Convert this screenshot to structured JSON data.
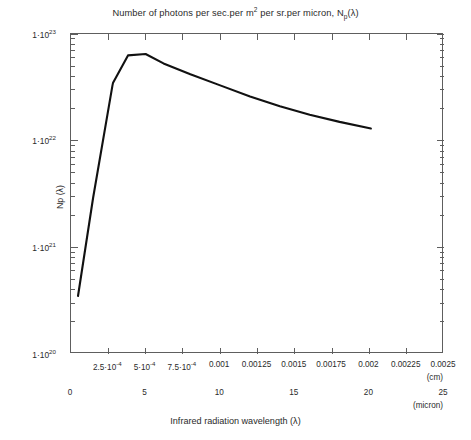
{
  "title_parts": {
    "lead": "Number of photons per sec.per m",
    "sup1": "2",
    "mid": " per sr.per micron, N",
    "sub1": "p",
    "tail": "(λ)"
  },
  "axes": {
    "y_title": "Np (λ)",
    "y_tick_labels": [
      "1·10",
      "1·10",
      "1·10",
      "1·10"
    ],
    "y_tick_exponents": [
      "23",
      "22",
      "21",
      "20"
    ],
    "x_title": "Infrared radiation wavelength (λ)",
    "x_unit_primary": "(cm)",
    "x_unit_secondary": "(micron)"
  },
  "caption": "",
  "chart_data": {
    "type": "line",
    "title": "Number of photons per sec.per m2 per sr.per micron, Np(λ)",
    "xlabel": "Infrared radiation wavelength (λ)",
    "ylabel": "Np (λ)",
    "yscale": "log",
    "ylim": [
      1e+20,
      1e+23
    ],
    "y_ticks": [
      1e+20,
      1e+21,
      1e+22,
      1e+23
    ],
    "y_tick_text": [
      "1·10^20",
      "1·10^21",
      "1·10^22",
      "1·10^23"
    ],
    "grid": false,
    "legend": null,
    "x_axis_primary": {
      "unit": "cm",
      "xlim": [
        0,
        0.0025
      ],
      "ticks": [
        0.00025,
        0.0005,
        0.00075,
        0.001,
        0.00125,
        0.0015,
        0.00175,
        0.002,
        0.00225,
        0.0025
      ],
      "tick_text": [
        "2.5·10^-4",
        "5·10^-4",
        "7.5·10^-4",
        "0.001",
        "0.00125",
        "0.0015",
        "0.00175",
        "0.002",
        "0.00225",
        "0.0025"
      ]
    },
    "x_axis_secondary": {
      "unit": "micron",
      "xlim": [
        0,
        25
      ],
      "ticks": [
        0,
        5,
        10,
        15,
        20,
        25
      ],
      "tick_text": [
        "0",
        "5",
        "10",
        "15",
        "20",
        "25"
      ]
    },
    "series": [
      {
        "name": "Np(λ)",
        "color": "#111111",
        "x_micron": [
          0.47,
          1.48,
          2.78,
          2.82,
          3.82,
          5.0,
          6.2,
          8.0,
          10.0,
          12.0,
          14.0,
          16.0,
          18.0,
          20.1
        ],
        "y": [
          3.5e+20,
          2.9e+21,
          3.3e+22,
          3.5e+22,
          6.3e+22,
          6.5e+22,
          5.3e+22,
          4.2e+22,
          3.3e+22,
          2.6e+22,
          2.1e+22,
          1.75e+22,
          1.5e+22,
          1.3e+22
        ]
      }
    ]
  }
}
